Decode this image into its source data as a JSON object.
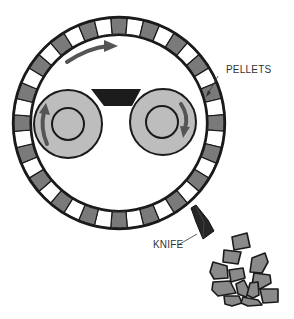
{
  "diagram": {
    "labels": {
      "pellets": "PELLETS",
      "knife": "KNIFE"
    },
    "colors": {
      "outline": "#1a1a1a",
      "ring_gray": "#7a7a7a",
      "ring_white": "#ffffff",
      "roller_fill": "#bdbdbd",
      "arrow": "#555555",
      "feed_block": "#1c1c1c",
      "knife": "#262626",
      "pellet_fill": "#8a8a8a"
    },
    "ring": {
      "cx": 119,
      "cy": 123,
      "r_outer": 106,
      "r_inner": 88,
      "segments": 40
    },
    "rollers": [
      {
        "name": "left-roller",
        "cx": 68,
        "cy": 124,
        "r": 34,
        "r_hub": 16,
        "rotation": "counterclockwise"
      },
      {
        "name": "right-roller",
        "cx": 163,
        "cy": 122,
        "r": 33,
        "r_hub": 16,
        "rotation": "clockwise"
      }
    ],
    "die_rotation": "clockwise"
  }
}
